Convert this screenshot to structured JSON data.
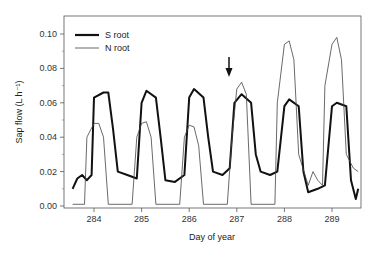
{
  "chart_data": {
    "type": "line",
    "title": "",
    "xlabel": "Day of year",
    "ylabel": "Sap flow (L h⁻¹)",
    "xlim": [
      283.5,
      289.6
    ],
    "ylim": [
      0,
      0.105
    ],
    "x_ticks": [
      "284",
      "285",
      "286",
      "287",
      "288",
      "289"
    ],
    "y_ticks": [
      "0.00",
      "0.02",
      "0.04",
      "0.06",
      "0.08",
      "0.10"
    ],
    "grid": false,
    "legend_position": "upper left",
    "annotation": {
      "type": "arrow",
      "x": 286.85,
      "label": ""
    },
    "series": [
      {
        "name": "S root",
        "style": "thick",
        "points": [
          [
            283.55,
            0.01
          ],
          [
            283.65,
            0.016
          ],
          [
            283.75,
            0.018
          ],
          [
            283.85,
            0.015
          ],
          [
            283.95,
            0.018
          ],
          [
            284.0,
            0.063
          ],
          [
            284.2,
            0.066
          ],
          [
            284.3,
            0.066
          ],
          [
            284.4,
            0.045
          ],
          [
            284.5,
            0.02
          ],
          [
            284.7,
            0.018
          ],
          [
            284.9,
            0.016
          ],
          [
            285.0,
            0.06
          ],
          [
            285.1,
            0.067
          ],
          [
            285.3,
            0.063
          ],
          [
            285.4,
            0.04
          ],
          [
            285.5,
            0.015
          ],
          [
            285.7,
            0.014
          ],
          [
            285.9,
            0.018
          ],
          [
            286.0,
            0.063
          ],
          [
            286.1,
            0.068
          ],
          [
            286.3,
            0.063
          ],
          [
            286.4,
            0.04
          ],
          [
            286.5,
            0.02
          ],
          [
            286.7,
            0.018
          ],
          [
            286.85,
            0.022
          ],
          [
            286.95,
            0.06
          ],
          [
            287.1,
            0.065
          ],
          [
            287.3,
            0.06
          ],
          [
            287.4,
            0.03
          ],
          [
            287.5,
            0.02
          ],
          [
            287.7,
            0.018
          ],
          [
            287.85,
            0.02
          ],
          [
            288.0,
            0.058
          ],
          [
            288.1,
            0.062
          ],
          [
            288.3,
            0.058
          ],
          [
            288.4,
            0.02
          ],
          [
            288.5,
            0.008
          ],
          [
            288.7,
            0.01
          ],
          [
            288.85,
            0.012
          ],
          [
            289.0,
            0.058
          ],
          [
            289.1,
            0.06
          ],
          [
            289.3,
            0.058
          ],
          [
            289.4,
            0.015
          ],
          [
            289.5,
            0.004
          ],
          [
            289.55,
            0.01
          ]
        ]
      },
      {
        "name": "N root",
        "style": "thin",
        "points": [
          [
            283.55,
            0.001
          ],
          [
            283.8,
            0.001
          ],
          [
            283.85,
            0.04
          ],
          [
            284.0,
            0.048
          ],
          [
            284.1,
            0.048
          ],
          [
            284.2,
            0.04
          ],
          [
            284.3,
            0.001
          ],
          [
            284.8,
            0.001
          ],
          [
            284.9,
            0.04
          ],
          [
            285.0,
            0.048
          ],
          [
            285.1,
            0.049
          ],
          [
            285.2,
            0.04
          ],
          [
            285.3,
            0.001
          ],
          [
            285.8,
            0.001
          ],
          [
            285.9,
            0.04
          ],
          [
            286.0,
            0.047
          ],
          [
            286.1,
            0.046
          ],
          [
            286.2,
            0.035
          ],
          [
            286.3,
            0.001
          ],
          [
            286.8,
            0.001
          ],
          [
            286.9,
            0.04
          ],
          [
            287.0,
            0.068
          ],
          [
            287.1,
            0.072
          ],
          [
            287.2,
            0.065
          ],
          [
            287.3,
            0.001
          ],
          [
            287.8,
            0.001
          ],
          [
            287.85,
            0.06
          ],
          [
            288.0,
            0.094
          ],
          [
            288.1,
            0.096
          ],
          [
            288.2,
            0.085
          ],
          [
            288.3,
            0.03
          ],
          [
            288.5,
            0.012
          ],
          [
            288.6,
            0.02
          ],
          [
            288.7,
            0.015
          ],
          [
            288.8,
            0.012
          ],
          [
            288.85,
            0.07
          ],
          [
            289.0,
            0.094
          ],
          [
            289.1,
            0.098
          ],
          [
            289.2,
            0.085
          ],
          [
            289.3,
            0.03
          ],
          [
            289.45,
            0.022
          ],
          [
            289.55,
            0.02
          ]
        ]
      }
    ]
  },
  "legend": {
    "items": [
      {
        "label": "S root"
      },
      {
        "label": "N root"
      }
    ]
  }
}
